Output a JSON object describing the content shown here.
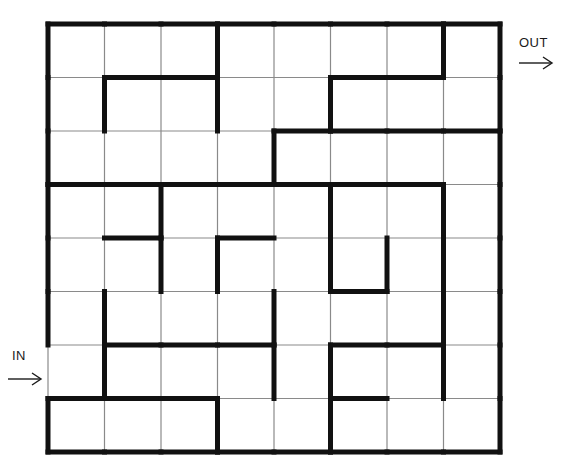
{
  "page": {
    "background_color": "#ffffff",
    "wall_color": "#111111",
    "thin_grid_color": "#8a8a8a",
    "label_color": "#1a1a1a"
  },
  "labels": {
    "entrance": "IN",
    "exit": "OUT",
    "entrance_arrow_icon": "arrow-right-icon",
    "exit_arrow_icon": "arrow-right-icon"
  },
  "maze": {
    "rows": 8,
    "cols": 8,
    "origin_x": 48,
    "origin_y": 24,
    "cell_width": 56.5,
    "cell_height": 53.5,
    "wall_thickness": 5,
    "thin_thickness": 1.2,
    "entrance": {
      "side": "left",
      "row": 7,
      "label": "IN"
    },
    "exit": {
      "side": "right",
      "row": 1,
      "label": "OUT"
    },
    "horizontal_walls": [
      [
        1,
        1,
        1,
        1,
        1,
        1,
        1,
        1
      ],
      [
        0,
        1,
        1,
        0,
        0,
        1,
        1,
        0
      ],
      [
        0,
        0,
        0,
        0,
        1,
        1,
        1,
        1
      ],
      [
        1,
        1,
        1,
        1,
        1,
        1,
        1,
        0
      ],
      [
        0,
        1,
        0,
        1,
        0,
        0,
        0,
        0
      ],
      [
        0,
        0,
        0,
        0,
        0,
        1,
        0,
        0
      ],
      [
        0,
        1,
        1,
        1,
        0,
        1,
        1,
        0
      ],
      [
        1,
        1,
        1,
        0,
        0,
        1,
        0,
        0
      ],
      [
        1,
        1,
        1,
        1,
        1,
        1,
        1,
        1
      ]
    ],
    "vertical_walls": [
      [
        1,
        0,
        0,
        1,
        0,
        0,
        0,
        1,
        1
      ],
      [
        1,
        1,
        0,
        1,
        0,
        1,
        0,
        0,
        1
      ],
      [
        1,
        0,
        0,
        0,
        1,
        0,
        0,
        0,
        1
      ],
      [
        1,
        0,
        1,
        0,
        0,
        1,
        0,
        1,
        1
      ],
      [
        1,
        0,
        1,
        1,
        0,
        1,
        1,
        1,
        1
      ],
      [
        1,
        1,
        0,
        0,
        1,
        0,
        0,
        1,
        1
      ],
      [
        0,
        1,
        0,
        0,
        1,
        1,
        0,
        1,
        1
      ],
      [
        1,
        0,
        0,
        1,
        0,
        1,
        0,
        0,
        1
      ]
    ]
  }
}
